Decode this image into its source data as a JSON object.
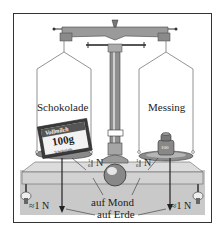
{
  "diagram": {
    "type": "balance-scale-illustration",
    "left_pan": {
      "label": "Schokolade",
      "object": "chocolate bar",
      "package_brand": "Vollmilch",
      "package_weight": "100g",
      "package_sub": "Schokolade"
    },
    "right_pan": {
      "label": "Messing",
      "object": "brass weight",
      "weight_mark": "100"
    },
    "moon_force_left": {
      "fraction_num": "1",
      "fraction_den": "6",
      "unit": "N"
    },
    "moon_force_right": {
      "fraction_num": "1",
      "fraction_den": "6",
      "unit": "N"
    },
    "earth_force_left": "≈1 N",
    "earth_force_right": "≈1 N",
    "caption_moon": "auf Mond",
    "caption_earth": "auf Erde",
    "colors": {
      "table": "#c8c8c8",
      "metal": "#9a9a9a",
      "line": "#333333"
    }
  }
}
